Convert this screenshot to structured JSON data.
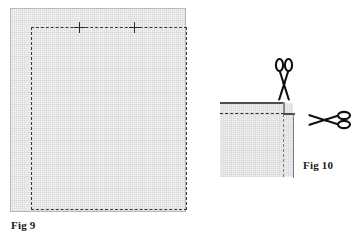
{
  "page": {
    "background": "#ffffff",
    "width": 352,
    "height": 239,
    "kind": "sewing-instruction-diagram"
  },
  "colors": {
    "fabric_fill": "#f1f1f1",
    "fabric_border": "#b8b8b8",
    "stitch_line": "#3a3a3a",
    "raw_edge": "#4d4d4d",
    "mark": "#2b2b2b",
    "label_text": "#1a1a1a",
    "scissors": "#111111"
  },
  "figures": [
    {
      "id": "fig9",
      "label": "Fig 9",
      "description": "Rectangular fabric panel with dashed stitching line inset from all four edges and two cross marks on the top stitching line",
      "marks": [
        {
          "name": "cross-mark-left",
          "glyph": "+"
        },
        {
          "name": "cross-mark-right",
          "glyph": "+"
        }
      ]
    },
    {
      "id": "fig10",
      "label": "Fig 10",
      "description": "Corner detail of folded fabric with dashed fold lines and two scissors indicating cut directions",
      "tools": [
        {
          "name": "scissors-vertical",
          "glyph": "scissors",
          "orientation": "vertical"
        },
        {
          "name": "scissors-horizontal",
          "glyph": "scissors",
          "orientation": "horizontal"
        }
      ]
    }
  ],
  "fig9": {
    "label": "Fig 9",
    "cross_left": "+",
    "cross_right": "+"
  },
  "fig10": {
    "label": "Fig 10"
  }
}
